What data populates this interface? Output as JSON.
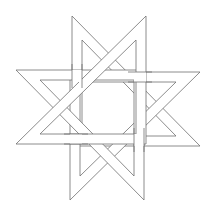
{
  "figure": {
    "title": "Interlaced eight-pointed star",
    "stroke_color": "#6e6e6e",
    "background": "#ffffff",
    "band_count": 4
  }
}
